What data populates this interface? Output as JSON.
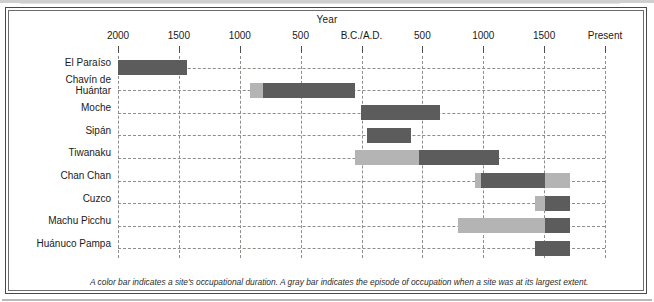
{
  "figure": {
    "axis_title": "Year",
    "caption": "A color bar indicates a site's occupational duration. A gray bar indicates the episode of occupation when a site was at its largest extent.",
    "colors": {
      "dark_bar": "#5c5c5c",
      "gray_bar": "#b4b4b4",
      "gridline": "#8d8d8a",
      "frame": "#4a4a4a",
      "background": "#ffffff"
    }
  },
  "chart_data": {
    "type": "bar",
    "orientation": "horizontal",
    "subtype": "timeline-gantt",
    "title": "",
    "xlabel": "Year",
    "ylabel": "",
    "grid": true,
    "legend": "none",
    "axis": {
      "unit": "years",
      "tick_labels": [
        "2000",
        "1500",
        "1000",
        "500",
        "B.C./A.D.",
        "500",
        "1000",
        "1500",
        "Present"
      ],
      "tick_values": [
        -2000,
        -1500,
        -1000,
        -500,
        0,
        500,
        1000,
        1500,
        2000
      ],
      "xlim": [
        -2000,
        2000
      ],
      "note": "Negative values are B.C., positive are A.D.; 'Present' is the right edge of the axis."
    },
    "categories": [
      "El Paraíso",
      "Chavín de Huántar",
      "Moche",
      "Sipán",
      "Tiwanaku",
      "Chan Chan",
      "Cuzco",
      "Machu Picchu",
      "Huánuco Pampa"
    ],
    "series": [
      {
        "name": "Occupational duration (color bar)",
        "color": "#5c5c5c",
        "spans": [
          {
            "category": "El Paraíso",
            "start": -2000,
            "end": -1430
          },
          {
            "category": "Chavín de Huántar",
            "start": -915,
            "end": -55
          },
          {
            "category": "Moche",
            "start": -5,
            "end": 645
          },
          {
            "category": "Sipán",
            "start": 45,
            "end": 405
          },
          {
            "category": "Tiwanaku",
            "start": -50,
            "end": 1130
          },
          {
            "category": "Chan Chan",
            "start": 930,
            "end": 1710
          },
          {
            "category": "Cuzco",
            "start": 1425,
            "end": 1715
          },
          {
            "category": "Machu Picchu",
            "start": 790,
            "end": 1715
          },
          {
            "category": "Huánuco Pampa",
            "start": 1425,
            "end": 1715
          }
        ]
      },
      {
        "name": "Largest extent (gray bar)",
        "color": "#b4b4b4",
        "spans": [
          {
            "category": "Chavín de Huántar",
            "start": -915,
            "end": -805
          },
          {
            "category": "Tiwanaku",
            "start": -50,
            "end": 475
          },
          {
            "category": "Chan Chan",
            "start": 930,
            "end": 980
          },
          {
            "category": "Chan Chan",
            "start": 1510,
            "end": 1710
          },
          {
            "category": "Cuzco",
            "start": 1425,
            "end": 1510
          },
          {
            "category": "Machu Picchu",
            "start": 790,
            "end": 1510
          }
        ]
      }
    ],
    "rows": [
      {
        "label": "El Paraíso",
        "label_lines": [
          "El Paraíso"
        ],
        "segments": [
          {
            "kind": "dark",
            "start": -2000,
            "end": -1430
          }
        ]
      },
      {
        "label": "Chavín de Huántar",
        "label_lines": [
          "Chavín de",
          "Huántar"
        ],
        "segments": [
          {
            "kind": "gray",
            "start": -915,
            "end": -805
          },
          {
            "kind": "dark",
            "start": -805,
            "end": -55
          }
        ]
      },
      {
        "label": "Moche",
        "label_lines": [
          "Moche"
        ],
        "segments": [
          {
            "kind": "dark",
            "start": -5,
            "end": 645
          }
        ]
      },
      {
        "label": "Sipán",
        "label_lines": [
          "Sipán"
        ],
        "segments": [
          {
            "kind": "dark",
            "start": 45,
            "end": 405
          }
        ]
      },
      {
        "label": "Tiwanaku",
        "label_lines": [
          "Tiwanaku"
        ],
        "segments": [
          {
            "kind": "gray",
            "start": -50,
            "end": 475
          },
          {
            "kind": "dark",
            "start": 475,
            "end": 1130
          }
        ]
      },
      {
        "label": "Chan Chan",
        "label_lines": [
          "Chan Chan"
        ],
        "segments": [
          {
            "kind": "gray",
            "start": 930,
            "end": 980
          },
          {
            "kind": "dark",
            "start": 980,
            "end": 1510
          },
          {
            "kind": "gray",
            "start": 1510,
            "end": 1710
          }
        ]
      },
      {
        "label": "Cuzco",
        "label_lines": [
          "Cuzco"
        ],
        "segments": [
          {
            "kind": "gray",
            "start": 1425,
            "end": 1510
          },
          {
            "kind": "dark",
            "start": 1510,
            "end": 1715
          }
        ]
      },
      {
        "label": "Machu Picchu",
        "label_lines": [
          "Machu Picchu"
        ],
        "segments": [
          {
            "kind": "gray",
            "start": 790,
            "end": 1510
          },
          {
            "kind": "dark",
            "start": 1510,
            "end": 1715
          }
        ]
      },
      {
        "label": "Huánuco Pampa",
        "label_lines": [
          "Huánuco Pampa"
        ],
        "segments": [
          {
            "kind": "dark",
            "start": 1425,
            "end": 1715
          }
        ]
      }
    ]
  }
}
